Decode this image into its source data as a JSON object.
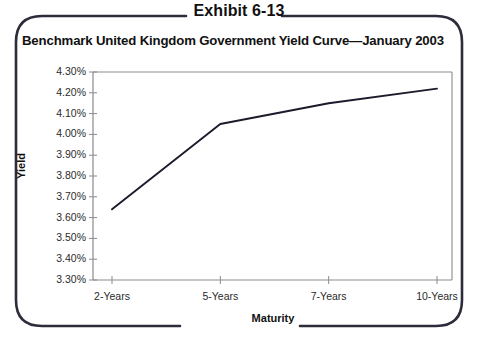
{
  "exhibit": {
    "label": "Exhibit 6-13"
  },
  "chart_data": {
    "type": "line",
    "title": "Benchmark United Kingdom Government Yield Curve—January 2003",
    "xlabel": "Maturity",
    "ylabel": "Yield",
    "categories": [
      "2-Years",
      "5-Years",
      "7-Years",
      "10-Years"
    ],
    "values": [
      3.64,
      4.05,
      4.15,
      4.22
    ],
    "series": [
      {
        "name": "UK Government Yield Curve",
        "values": [
          3.64,
          4.05,
          4.15,
          4.22
        ]
      }
    ],
    "ylim": [
      3.3,
      4.3
    ],
    "ytick_labels": [
      "4.30%",
      "4.20%",
      "4.10%",
      "4.00%",
      "3.90%",
      "3.80%",
      "3.70%",
      "3.60%",
      "3.50%",
      "3.40%",
      "3.30%"
    ],
    "ytick_values": [
      4.3,
      4.2,
      4.1,
      4.0,
      3.9,
      3.8,
      3.7,
      3.6,
      3.5,
      3.4,
      3.3
    ],
    "grid": false,
    "legend": "none",
    "line_color": "#1b1b2b",
    "axis_color": "#8b8b90",
    "frame_color": "#2c2c3a"
  }
}
